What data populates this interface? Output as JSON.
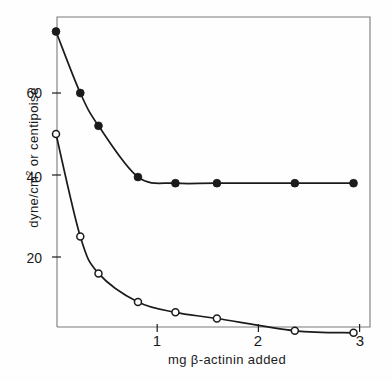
{
  "figure": {
    "scan_artifact_text": "",
    "background_color": "#fefefe",
    "ink_color": "#1b1b1b"
  },
  "axes": {
    "ylabel_main": "dyne/cm",
    "ylabel_sup": "2",
    "ylabel_rest": " or centipoise",
    "ylabel_full": "dyne/cm2 or centipoise",
    "xlabel": "mg β-actinin added",
    "ytick_labels": [
      "60",
      "40",
      "20"
    ],
    "xtick_labels": [
      "1",
      "2",
      "3"
    ]
  },
  "chart_data": {
    "type": "line",
    "title": "",
    "subtitle": "",
    "xlabel": "mg β-actinin added",
    "ylabel": "dyne/cm2 or centipoise",
    "xlim": [
      0,
      3.1
    ],
    "ylim": [
      0,
      79
    ],
    "xticks": [
      1,
      2,
      3
    ],
    "yticks": [
      20,
      40,
      60
    ],
    "grid": false,
    "legend": "none",
    "marker_size_px": 5,
    "series": [
      {
        "name": "dyne/cm2",
        "marker": "filled-circle",
        "color": "#1b1b1b",
        "x": [
          0.0,
          0.24,
          0.42,
          0.81,
          1.18,
          1.59,
          2.36,
          2.94
        ],
        "values": [
          75.0,
          60.0,
          52.0,
          39.5,
          38.0,
          38.0,
          38.0,
          38.0
        ]
      },
      {
        "name": "centipoise",
        "marker": "open-circle",
        "color": "#1b1b1b",
        "x": [
          0.0,
          0.24,
          0.42,
          0.81,
          1.18,
          1.59,
          2.36,
          2.94
        ],
        "values": [
          50.0,
          25.0,
          16.0,
          9.0,
          6.5,
          5.0,
          2.0,
          1.5
        ]
      }
    ],
    "annotations": []
  }
}
